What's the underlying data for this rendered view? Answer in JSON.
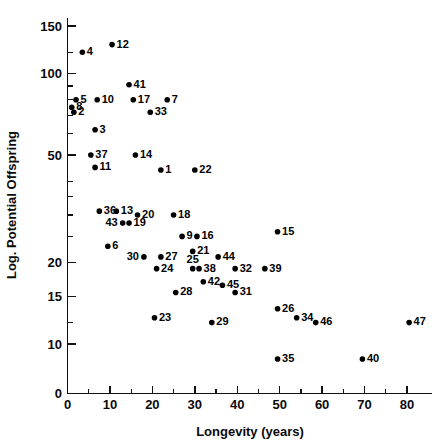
{
  "chart_data": {
    "type": "scatter",
    "title": "",
    "xlabel": "Longevity (years)",
    "ylabel": "Log. Potential Offspring",
    "xlim": [
      0,
      84
    ],
    "ylim": [
      7,
      170
    ],
    "yscale": "log",
    "xscale": "linear",
    "grid": false,
    "legend": null,
    "x_ticks_major": [
      0,
      10,
      20,
      30,
      40,
      50,
      60,
      70,
      80
    ],
    "x_ticks_major_labels": [
      "0",
      "10",
      "20",
      "30",
      "40",
      "50",
      "60",
      "70",
      "80"
    ],
    "x_ticks_minor": [
      5,
      15,
      25,
      35,
      45,
      55,
      65,
      75
    ],
    "y_ticks_major": [
      10,
      15,
      20,
      50,
      100,
      150
    ],
    "y_ticks_major_labels": [
      "10",
      "15",
      "20",
      "50",
      "100",
      "150"
    ],
    "y_ticks_minor": [
      12,
      25,
      30,
      35,
      40,
      60,
      70,
      80,
      90,
      120
    ],
    "point_label_field": "label",
    "points": [
      {
        "label": "4",
        "x": 3.5,
        "y": 120,
        "label_pos": "right"
      },
      {
        "label": "12",
        "x": 10.5,
        "y": 128,
        "label_pos": "right"
      },
      {
        "label": "41",
        "x": 14.5,
        "y": 91,
        "label_pos": "right"
      },
      {
        "label": "5",
        "x": 2.0,
        "y": 80,
        "label_pos": "right"
      },
      {
        "label": "10",
        "x": 7.0,
        "y": 80,
        "label_pos": "right"
      },
      {
        "label": "17",
        "x": 15.5,
        "y": 80,
        "label_pos": "right"
      },
      {
        "label": "7",
        "x": 23.5,
        "y": 80,
        "label_pos": "right"
      },
      {
        "label": "8",
        "x": 1.0,
        "y": 75,
        "label_pos": "right"
      },
      {
        "label": "2",
        "x": 1.5,
        "y": 72,
        "label_pos": "right"
      },
      {
        "label": "33",
        "x": 19.5,
        "y": 72,
        "label_pos": "right"
      },
      {
        "label": "3",
        "x": 6.5,
        "y": 62,
        "label_pos": "right"
      },
      {
        "label": "37",
        "x": 5.5,
        "y": 50,
        "label_pos": "right"
      },
      {
        "label": "14",
        "x": 16.0,
        "y": 50,
        "label_pos": "right"
      },
      {
        "label": "11",
        "x": 6.5,
        "y": 45,
        "label_pos": "right"
      },
      {
        "label": "1",
        "x": 22.0,
        "y": 44,
        "label_pos": "right"
      },
      {
        "label": "22",
        "x": 30.0,
        "y": 44,
        "label_pos": "right"
      },
      {
        "label": "36",
        "x": 7.5,
        "y": 31,
        "label_pos": "right"
      },
      {
        "label": "13",
        "x": 11.5,
        "y": 31,
        "label_pos": "right"
      },
      {
        "label": "20",
        "x": 16.5,
        "y": 30,
        "label_pos": "right"
      },
      {
        "label": "18",
        "x": 25.0,
        "y": 30,
        "label_pos": "right"
      },
      {
        "label": "43",
        "x": 13.0,
        "y": 28,
        "label_pos": "left"
      },
      {
        "label": "19",
        "x": 14.5,
        "y": 28,
        "label_pos": "right"
      },
      {
        "label": "9",
        "x": 27.0,
        "y": 25,
        "label_pos": "right"
      },
      {
        "label": "16",
        "x": 30.5,
        "y": 25,
        "label_pos": "right"
      },
      {
        "label": "15",
        "x": 49.5,
        "y": 26,
        "label_pos": "right"
      },
      {
        "label": "6",
        "x": 9.5,
        "y": 23,
        "label_pos": "right"
      },
      {
        "label": "30",
        "x": 18.0,
        "y": 21,
        "label_pos": "left"
      },
      {
        "label": "27",
        "x": 22.0,
        "y": 21,
        "label_pos": "right"
      },
      {
        "label": "21",
        "x": 29.5,
        "y": 22,
        "label_pos": "right"
      },
      {
        "label": "44",
        "x": 35.5,
        "y": 21,
        "label_pos": "right"
      },
      {
        "label": "24",
        "x": 21.0,
        "y": 19,
        "label_pos": "right"
      },
      {
        "label": "25",
        "x": 29.5,
        "y": 19,
        "label_pos": "above"
      },
      {
        "label": "38",
        "x": 31.0,
        "y": 19,
        "label_pos": "right"
      },
      {
        "label": "32",
        "x": 39.5,
        "y": 19,
        "label_pos": "right"
      },
      {
        "label": "39",
        "x": 46.5,
        "y": 19,
        "label_pos": "right"
      },
      {
        "label": "42",
        "x": 32.0,
        "y": 17,
        "label_pos": "right"
      },
      {
        "label": "45",
        "x": 36.5,
        "y": 16.5,
        "label_pos": "right"
      },
      {
        "label": "28",
        "x": 25.5,
        "y": 15.5,
        "label_pos": "right"
      },
      {
        "label": "31",
        "x": 39.5,
        "y": 15.5,
        "label_pos": "right"
      },
      {
        "label": "26",
        "x": 49.5,
        "y": 13.5,
        "label_pos": "right"
      },
      {
        "label": "34",
        "x": 54.0,
        "y": 12.5,
        "label_pos": "right"
      },
      {
        "label": "46",
        "x": 58.5,
        "y": 12,
        "label_pos": "right"
      },
      {
        "label": "47",
        "x": 80.5,
        "y": 12,
        "label_pos": "right"
      },
      {
        "label": "23",
        "x": 20.5,
        "y": 12.5,
        "label_pos": "right"
      },
      {
        "label": "29",
        "x": 34.0,
        "y": 12,
        "label_pos": "right"
      },
      {
        "label": "35",
        "x": 49.5,
        "y": 8.8,
        "label_pos": "right"
      },
      {
        "label": "40",
        "x": 69.5,
        "y": 8.8,
        "label_pos": "right"
      }
    ]
  }
}
